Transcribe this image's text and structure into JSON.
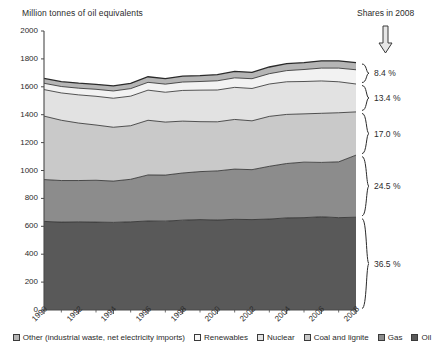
{
  "chart_data": {
    "type": "area",
    "title": "",
    "ylabel": "Million tonnes of oil equivalents",
    "xlabel": "",
    "ylim": [
      0,
      2000
    ],
    "ytick_values": [
      0,
      200,
      400,
      600,
      800,
      1000,
      1200,
      1400,
      1600,
      1800,
      2000
    ],
    "ytick_labels": [
      "0",
      "200",
      "400",
      "600",
      "800",
      "1000",
      "1200",
      "1400",
      "1600",
      "1800",
      "2000"
    ],
    "grid": false,
    "legend_position": "bottom",
    "x": [
      1990,
      1991,
      1992,
      1993,
      1994,
      1995,
      1996,
      1997,
      1998,
      1999,
      2000,
      2001,
      2002,
      2003,
      2004,
      2005,
      2006,
      2007,
      2008
    ],
    "xtick_labels": [
      "1990",
      "1992",
      "1994",
      "1996",
      "1998",
      "2000",
      "2002",
      "2004",
      "2006",
      "2008"
    ],
    "stack_order_bottom_to_top": [
      "Oil",
      "Gas",
      "Coal and lignite",
      "Nuclear",
      "Renewables",
      "Other (industrial waste, net electricity imports)"
    ],
    "series": [
      {
        "name": "Oil",
        "color": "#595959",
        "values": [
          635,
          630,
          632,
          630,
          628,
          632,
          638,
          637,
          644,
          648,
          645,
          650,
          648,
          652,
          660,
          662,
          668,
          662,
          665
        ]
      },
      {
        "name": "Gas",
        "color": "#8c8c8c",
        "values": [
          300,
          298,
          296,
          300,
          296,
          305,
          330,
          330,
          338,
          344,
          352,
          360,
          358,
          378,
          390,
          398,
          390,
          400,
          445
        ]
      },
      {
        "name": "Coal and lignite",
        "color": "#c9c9c9",
        "values": [
          455,
          432,
          412,
          396,
          386,
          384,
          392,
          380,
          372,
          358,
          352,
          356,
          350,
          358,
          352,
          346,
          352,
          352,
          310
        ]
      },
      {
        "name": "Nuclear",
        "color": "#e2e2e2",
        "values": [
          190,
          196,
          202,
          206,
          208,
          212,
          216,
          214,
          220,
          226,
          228,
          230,
          232,
          232,
          234,
          232,
          232,
          222,
          200
        ]
      },
      {
        "name": "Renewables",
        "color": "#f2f2f2",
        "values": [
          45,
          46,
          48,
          50,
          52,
          54,
          56,
          58,
          60,
          62,
          66,
          68,
          70,
          74,
          80,
          86,
          92,
          98,
          102
        ]
      },
      {
        "name": "Other (industrial waste, net electricity imports)",
        "color": "#b5b5b5",
        "values": [
          35,
          35,
          36,
          36,
          36,
          38,
          40,
          40,
          42,
          42,
          44,
          46,
          46,
          48,
          50,
          50,
          52,
          52,
          52
        ]
      }
    ],
    "totals_note": "",
    "annotations": {
      "shares_title": "Shares in 2008",
      "arrow": "down-arrow",
      "shares": [
        {
          "label": "8.4 %",
          "series": "Other (industrial waste, net electricity imports) + Renewables"
        },
        {
          "label": "13.4 %",
          "series": "Nuclear"
        },
        {
          "label": "17.0 %",
          "series": "Coal and lignite"
        },
        {
          "label": "24.5 %",
          "series": "Gas"
        },
        {
          "label": "36.5 %",
          "series": "Oil"
        }
      ]
    }
  },
  "legend": {
    "items": [
      {
        "label": "Other (industrial waste, net electricity imports)",
        "color": "#b5b5b5"
      },
      {
        "label": "Renewables",
        "color": "#f7f7f7"
      },
      {
        "label": "Nuclear",
        "color": "#e2e2e2"
      },
      {
        "label": "Coal and lignite",
        "color": "#c9c9c9"
      },
      {
        "label": "Gas",
        "color": "#8c8c8c"
      },
      {
        "label": "Oil",
        "color": "#595959"
      }
    ]
  }
}
